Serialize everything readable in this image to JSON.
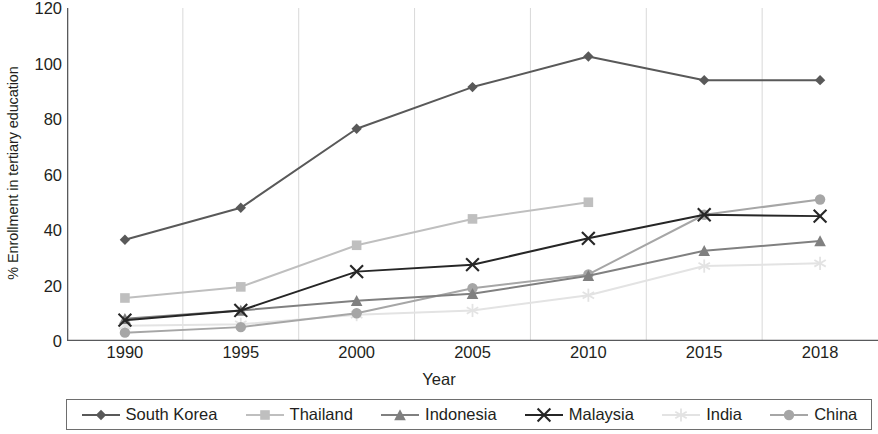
{
  "chart_data": {
    "type": "line",
    "title": "",
    "xlabel": "Year",
    "ylabel": "% Enrollment in tertiary education",
    "categories": [
      "1990",
      "1995",
      "2000",
      "2005",
      "2010",
      "2015",
      "2018"
    ],
    "x": [
      1990,
      1995,
      2000,
      2005,
      2010,
      2015,
      2018
    ],
    "ylim": [
      0,
      120
    ],
    "yticks": [
      0,
      20,
      40,
      60,
      80,
      100,
      120
    ],
    "grid": "vertical-category-boundaries",
    "legend_position": "bottom",
    "series": [
      {
        "name": "South Korea",
        "marker": "diamond",
        "color": "#595959",
        "values": [
          36.5,
          48.0,
          76.5,
          91.5,
          102.5,
          94.0,
          94.0
        ]
      },
      {
        "name": "Thailand",
        "marker": "square",
        "color": "#bfbfbf",
        "values": [
          15.5,
          19.5,
          34.5,
          44.0,
          50.0,
          null,
          null
        ]
      },
      {
        "name": "Indonesia",
        "marker": "triangle",
        "color": "#808080",
        "values": [
          8.0,
          11.0,
          14.5,
          17.0,
          23.5,
          32.5,
          36.0
        ]
      },
      {
        "name": "Malaysia",
        "marker": "x",
        "color": "#262626",
        "values": [
          7.5,
          11.0,
          25.0,
          27.5,
          37.0,
          45.5,
          45.0
        ]
      },
      {
        "name": "India",
        "marker": "asterisk",
        "color": "#e3e3e3",
        "values": [
          5.5,
          6.0,
          9.5,
          11.0,
          16.5,
          27.0,
          28.0
        ]
      },
      {
        "name": "China",
        "marker": "circle",
        "color": "#a6a6a6",
        "values": [
          3.0,
          5.0,
          10.0,
          19.0,
          24.0,
          45.5,
          51.0
        ]
      }
    ]
  },
  "axes": {
    "ylabel": "% Enrollment in tertiary education",
    "xlabel": "Year",
    "ytick_labels": [
      "120",
      "100",
      "80",
      "60",
      "40",
      "20",
      "0"
    ],
    "xtick_labels": [
      "1990",
      "1995",
      "2000",
      "2005",
      "2010",
      "2015",
      "2018"
    ]
  },
  "legend": {
    "items": [
      {
        "label": "South Korea"
      },
      {
        "label": "Thailand"
      },
      {
        "label": "Indonesia"
      },
      {
        "label": "Malaysia"
      },
      {
        "label": "India"
      },
      {
        "label": "China"
      }
    ]
  },
  "style": {
    "axis_color": "#58595b",
    "grid_color": "#d9d9d9",
    "text_color": "#231f20"
  }
}
